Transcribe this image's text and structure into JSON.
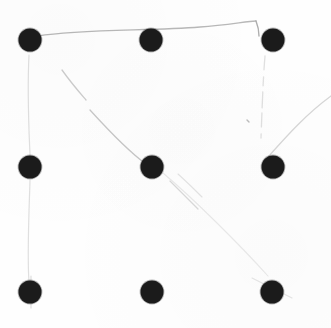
{
  "document": {
    "title": "Nine Dot Grid Sketch",
    "medium": "scanned paper",
    "background_color": "#fefefe",
    "width": 331,
    "height": 328
  },
  "palette": {
    "dot_core": "#1b1b1b",
    "dot_edge": "#2e2e2e",
    "line_strong": "#b9b9b9",
    "line_faint": "#dddddd",
    "line_ghost": "#ececec",
    "paper": "#fefefe"
  },
  "dots": [
    {
      "id": "dot-top-left",
      "label": "top left",
      "row": 0,
      "col": 0,
      "cx": 30,
      "cy": 40,
      "r": 11.5
    },
    {
      "id": "dot-top-center",
      "label": "top center",
      "row": 0,
      "col": 1,
      "cx": 151,
      "cy": 40,
      "r": 11.5
    },
    {
      "id": "dot-top-right",
      "label": "top right",
      "row": 0,
      "col": 2,
      "cx": 273,
      "cy": 40,
      "r": 11.5
    },
    {
      "id": "dot-middle-left",
      "label": "middle left",
      "row": 1,
      "col": 0,
      "cx": 30,
      "cy": 167,
      "r": 11.5
    },
    {
      "id": "dot-center",
      "label": "center",
      "row": 1,
      "col": 1,
      "cx": 152,
      "cy": 167,
      "r": 11.5
    },
    {
      "id": "dot-middle-right",
      "label": "middle right",
      "row": 1,
      "col": 2,
      "cx": 273,
      "cy": 167,
      "r": 11.5
    },
    {
      "id": "dot-bottom-left",
      "label": "bottom left",
      "row": 2,
      "col": 0,
      "cx": 30,
      "cy": 292,
      "r": 11.5
    },
    {
      "id": "dot-bottom-center",
      "label": "bottom center",
      "row": 2,
      "col": 1,
      "cx": 152,
      "cy": 292,
      "r": 11.5
    },
    {
      "id": "dot-bottom-right",
      "label": "bottom right",
      "row": 2,
      "col": 2,
      "cx": 272,
      "cy": 292,
      "r": 11.5
    }
  ],
  "strokes": [
    {
      "id": "stroke-top-edge",
      "label": "top horizontal stroke",
      "d": "M 38 36 C 80 29, 150 31, 200 27 C 228 25, 248 21, 256 21",
      "color": "#b4b4b4",
      "width": 1.3,
      "opacity": 0.95
    },
    {
      "id": "stroke-top-right-hook",
      "label": "top right descending hook",
      "d": "M 256 21 C 258 26, 259 30, 259 36",
      "color": "#aaaaaa",
      "width": 1.4,
      "opacity": 0.95
    },
    {
      "id": "stroke-left-edge",
      "label": "left vertical stroke",
      "d": "M 29 55 C 27 95, 29 130, 30 155 M 30 180 C 29 215, 27 255, 29 282",
      "color": "#dcdcdc",
      "width": 1.2,
      "opacity": 0.9
    },
    {
      "id": "stroke-right-edge",
      "label": "right vertical dashed stroke",
      "d": "M 265 56 C 263 80, 262 110, 261 138",
      "color": "#dadada",
      "width": 1.3,
      "opacity": 0.85,
      "dash": "14 7 9 6 16 5"
    },
    {
      "id": "stroke-diagonal-main",
      "label": "main diagonal toward center",
      "d": "M 62 70 C 72 84, 80 93, 86 100",
      "color": "#c6c6c6",
      "width": 1.3,
      "opacity": 0.9
    },
    {
      "id": "stroke-diagonal-lower",
      "label": "diagonal continuing into center dot",
      "d": "M 90 110 C 110 132, 132 154, 146 164",
      "color": "#c2c2c2",
      "width": 1.3,
      "opacity": 0.92
    },
    {
      "id": "stroke-diagonal-right-upper",
      "label": "diagonal from centre to right upper corner",
      "d": "M 163 173 C 195 200, 240 245, 268 276",
      "color": "#e2e2e2",
      "width": 1.1,
      "opacity": 0.75
    },
    {
      "id": "stroke-short-parallel-a",
      "label": "short parallel mark below centre",
      "d": "M 170 181 C 181 192, 190 201, 198 209",
      "color": "#d2d2d2",
      "width": 1.2,
      "opacity": 0.85
    },
    {
      "id": "stroke-short-parallel-b",
      "label": "second short parallel mark",
      "d": "M 178 174 C 188 183, 196 191, 202 197",
      "color": "#dcdcdc",
      "width": 1.1,
      "opacity": 0.8
    },
    {
      "id": "stroke-right-ascender",
      "label": "stroke rising from middle right dot to corner",
      "d": "M 268 157 C 285 138, 305 115, 331 96",
      "color": "#d0d0d0",
      "width": 1.3,
      "opacity": 0.88
    },
    {
      "id": "stroke-bottom-left-tick",
      "label": "short vertical tick at bottom left dot",
      "d": "M 31 276 L 31 308",
      "color": "#cccccc",
      "width": 1.1,
      "opacity": 0.7
    },
    {
      "id": "stroke-bottom-right-tick",
      "label": "short diagonal tick at bottom right dot",
      "d": "M 252 278 C 262 283, 276 290, 292 298",
      "color": "#d8d8d8",
      "width": 1.1,
      "opacity": 0.7
    },
    {
      "id": "stroke-speck",
      "label": "faint ink speck",
      "d": "M 247 120 L 249 122",
      "color": "#b0b0b0",
      "width": 1.4,
      "opacity": 0.85
    }
  ]
}
